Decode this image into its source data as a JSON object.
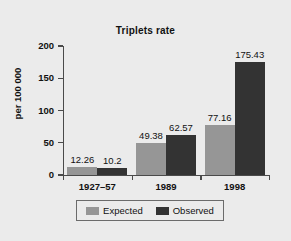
{
  "chart_data": {
    "type": "bar",
    "title": "Triplets rate",
    "xlabel": "",
    "ylabel": "per 100 000",
    "categories": [
      "1927–57",
      "1989",
      "1998"
    ],
    "series": [
      {
        "name": "Expected",
        "color": "#969696",
        "values": [
          12.26,
          49.38,
          77.16
        ]
      },
      {
        "name": "Observed",
        "color": "#333333",
        "values": [
          10.2,
          62.57,
          175.43
        ]
      }
    ],
    "value_labels": [
      [
        "12.26",
        "10.2"
      ],
      [
        "49.38",
        "62.57"
      ],
      [
        "77.16",
        "175.43"
      ]
    ],
    "ylim": [
      0,
      200
    ],
    "yticks": [
      0,
      50,
      100,
      150,
      200
    ],
    "ytick_labels": [
      "0",
      "50",
      "100",
      "150",
      "200"
    ],
    "grid": false,
    "legend_position": "bottom",
    "background_color": "#ebebeb",
    "axis_color": "#4a4a4a"
  },
  "legend": {
    "entries": [
      {
        "label": "Expected"
      },
      {
        "label": "Observed"
      }
    ]
  }
}
